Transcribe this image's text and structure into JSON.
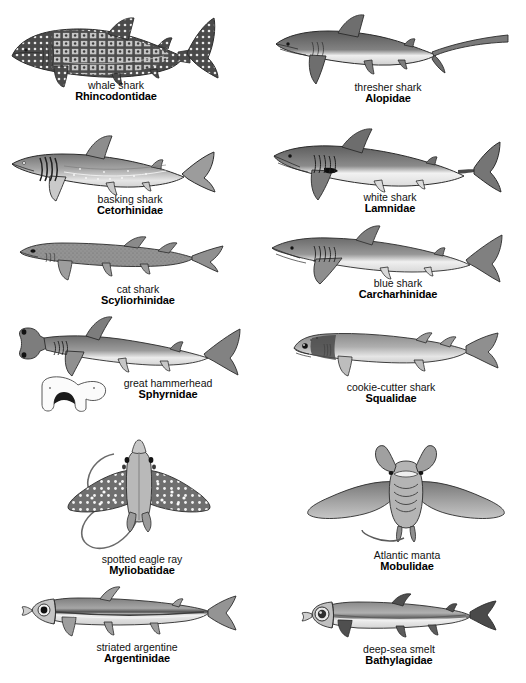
{
  "plate": {
    "title": "Sharks, Rays and Deep-Sea Fishes",
    "background_color": "#ffffff",
    "ink_color": "#4a4a4a",
    "outline_color": "#2b2b2b",
    "columns": 2,
    "rows": 6
  },
  "specimens": [
    {
      "id": "whale-shark",
      "common": "whale shark",
      "family": "Rhincodontidae",
      "column": "left",
      "row": 1,
      "body_tone": "#555555",
      "pattern": "checkerboard-spots"
    },
    {
      "id": "thresher-shark",
      "common": "thresher shark",
      "family": "Alopidae",
      "column": "right",
      "row": 1,
      "body_tone": "#6d6d6d",
      "pattern": "long-upper-tail-lobe"
    },
    {
      "id": "basking-shark",
      "common": "basking shark",
      "family": "Cetorhinidae",
      "column": "left",
      "row": 2,
      "body_tone": "#8a8a8a",
      "pattern": "long-gill-slits"
    },
    {
      "id": "white-shark",
      "common": "white shark",
      "family": "Lamnidae",
      "column": "right",
      "row": 2,
      "body_tone": "#7b7b7b",
      "pattern": "black-pectoral-axil-spot"
    },
    {
      "id": "cat-shark",
      "common": "cat shark",
      "family": "Scyliorhinidae",
      "column": "left",
      "row": 3,
      "body_tone": "#8f8f8f",
      "pattern": "slender-elongate"
    },
    {
      "id": "blue-shark",
      "common": "blue shark",
      "family": "Carcharhinidae",
      "column": "right",
      "row": 3,
      "body_tone": "#8a8a8a",
      "pattern": "long-pectoral-fins"
    },
    {
      "id": "great-hammerhead",
      "common": "great hammerhead",
      "family": "Sphyrnidae",
      "column": "left",
      "row": 4,
      "body_tone": "#8c8c8c",
      "pattern": "cephalofoil-head",
      "has_head_inset": true,
      "inset_label": "ventral head view"
    },
    {
      "id": "cookie-cutter-shark",
      "common": "cookie-cutter shark",
      "family": "Squalidae",
      "column": "right",
      "row": 4,
      "body_tone": "#9a9a9a",
      "pattern": "dark-collar-band"
    },
    {
      "id": "spotted-eagle-ray",
      "common": "spotted eagle ray",
      "family": "Myliobatidae",
      "column": "left",
      "row": 5,
      "body_tone": "#7a7a7a",
      "pattern": "white-spots-dorsal-view"
    },
    {
      "id": "atlantic-manta",
      "common": "Atlantic manta",
      "family": "Mobulidae",
      "column": "right",
      "row": 5,
      "body_tone": "#8e8e8e",
      "pattern": "cephalic-lobes-frontal-view"
    },
    {
      "id": "striated-argentine",
      "common": "striated argentine",
      "family": "Argentinidae",
      "column": "left",
      "row": 6,
      "body_tone": "#9b9b9b",
      "pattern": "lateral-silver-stripe"
    },
    {
      "id": "deep-sea-smelt",
      "common": "deep-sea smelt",
      "family": "Bathylagidae",
      "column": "right",
      "row": 6,
      "body_tone": "#9b9b9b",
      "pattern": "large-eye"
    }
  ]
}
